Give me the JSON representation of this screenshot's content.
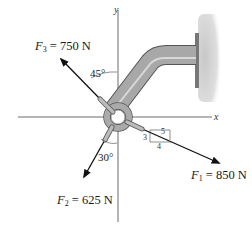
{
  "diagram": {
    "axes": {
      "x_label": "x",
      "y_label": "y"
    },
    "forces": [
      {
        "name": "F",
        "sub": "1",
        "value": "= 850 N",
        "direction": "slope 3-4-5 down-right"
      },
      {
        "name": "F",
        "sub": "2",
        "value": "= 625 N",
        "direction": "30° from -y axis"
      },
      {
        "name": "F",
        "sub": "3",
        "value": "= 750 N",
        "direction": "45° from +y axis"
      }
    ],
    "angles": {
      "f3": "45°",
      "f2": "30°"
    },
    "slope_triangle": {
      "hyp": "5",
      "vert": "3",
      "horiz": "4"
    },
    "colors": {
      "pipe": "#9a9a9a",
      "pipe_light": "#c4c4c4",
      "wall": "#cfcfcf",
      "arrow": "#111111"
    }
  }
}
